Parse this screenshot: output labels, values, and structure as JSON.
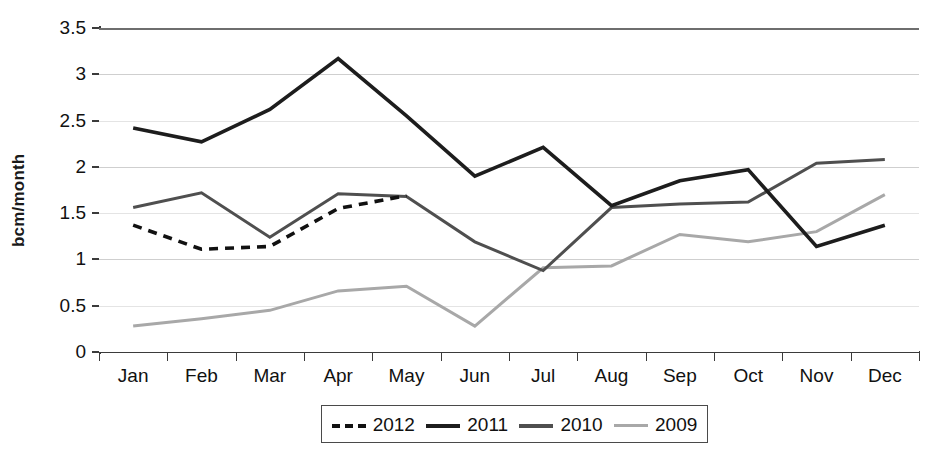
{
  "chart_data": {
    "type": "line",
    "title": "",
    "xlabel": "",
    "ylabel": "bcm/month",
    "categories": [
      "Jan",
      "Feb",
      "Mar",
      "Apr",
      "May",
      "Jun",
      "Jul",
      "Aug",
      "Sep",
      "Oct",
      "Nov",
      "Dec"
    ],
    "ylim": [
      0,
      3.5
    ],
    "ytick_labels": [
      "0",
      "0.5",
      "1",
      "1.5",
      "2",
      "2.5",
      "3",
      "3.5"
    ],
    "ytick_values": [
      0,
      0.5,
      1,
      1.5,
      2,
      2.5,
      3,
      3.5
    ],
    "grid": true,
    "legend_position": "bottom",
    "series": [
      {
        "name": "2012",
        "color": "#111111",
        "style": "dashed",
        "values": [
          1.37,
          1.11,
          1.14,
          1.55,
          1.69,
          null,
          null,
          null,
          null,
          null,
          null,
          null
        ]
      },
      {
        "name": "2011",
        "color": "#1d1d1d",
        "style": "solid",
        "values": [
          2.42,
          2.27,
          2.62,
          3.17,
          2.55,
          1.9,
          2.21,
          1.58,
          1.85,
          1.97,
          1.14,
          1.37
        ]
      },
      {
        "name": "2010",
        "color": "#4f4f4f",
        "style": "solid",
        "values": [
          1.56,
          1.72,
          1.24,
          1.71,
          1.68,
          1.19,
          0.88,
          1.56,
          1.6,
          1.62,
          2.04,
          2.08
        ]
      },
      {
        "name": "2009",
        "color": "#a8a8a8",
        "style": "solid",
        "values": [
          0.28,
          0.36,
          0.45,
          0.66,
          0.71,
          0.28,
          0.91,
          0.93,
          1.27,
          1.19,
          1.3,
          1.7
        ]
      }
    ]
  },
  "legend": {
    "items": [
      {
        "label": "2012",
        "color": "#111111",
        "style": "dashed"
      },
      {
        "label": "2011",
        "color": "#1d1d1d",
        "style": "solid"
      },
      {
        "label": "2010",
        "color": "#4f4f4f",
        "style": "solid"
      },
      {
        "label": "2009",
        "color": "#a8a8a8",
        "style": "solid"
      }
    ]
  },
  "colors": {
    "axis": "#3b3b3b",
    "grid": "#cfcfcf",
    "grid_light": "#e4e4e4",
    "background": "#ffffff",
    "text": "#111111"
  }
}
